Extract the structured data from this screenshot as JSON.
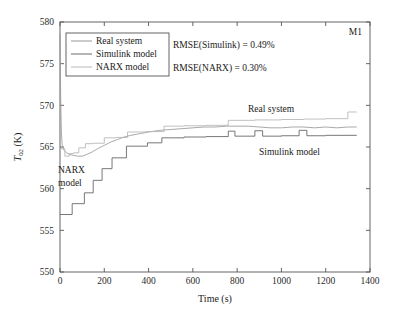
{
  "figure": {
    "corner_label": "M1",
    "background": "#ffffff"
  },
  "axes": {
    "x": {
      "title": "Time (s)",
      "min": 0,
      "max": 1400,
      "ticks": [
        0,
        200,
        400,
        600,
        800,
        1000,
        1200,
        1400
      ],
      "tick_labels": [
        "0",
        "200",
        "400",
        "600",
        "800",
        "1000",
        "1200",
        "1400"
      ]
    },
    "y": {
      "title_main": "T",
      "title_sub": "02",
      "title_unit": " (K)",
      "title": "T02 (K)",
      "min": 550,
      "max": 580,
      "ticks": [
        550,
        555,
        560,
        565,
        570,
        575,
        580
      ],
      "tick_labels": [
        "550",
        "555",
        "560",
        "565",
        "570",
        "575",
        "580"
      ]
    }
  },
  "legend": {
    "position": "top-left-inside",
    "entries": [
      {
        "label": "Real system",
        "color": "#8c8c8c"
      },
      {
        "label": "Simulink model",
        "color": "#5a5a5a"
      },
      {
        "label": "NARX model",
        "color": "#b0b0b0"
      }
    ]
  },
  "annotations": [
    {
      "name": "rmse-simulink",
      "text": "RMSE(Simulink) = 0.49%",
      "x": 173,
      "y": 48
    },
    {
      "name": "rmse-narx",
      "text": "RMSE(NARX) = 0.30%",
      "x": 173,
      "y": 71
    },
    {
      "name": "label-real-system",
      "text": "Real system",
      "x": 248,
      "y": 112
    },
    {
      "name": "label-simulink-model",
      "text": "Simulink model",
      "x": 259,
      "y": 155
    },
    {
      "name": "label-narx-model-line1",
      "text": "NARX",
      "x": 58,
      "y": 173
    },
    {
      "name": "label-narx-model-line2",
      "text": "model",
      "x": 58,
      "y": 186
    }
  ],
  "chart_data": {
    "type": "line",
    "title": "",
    "xlabel": "Time (s)",
    "ylabel": "T02 (K)",
    "xlim": [
      0,
      1400
    ],
    "ylim": [
      550,
      580
    ],
    "grid": false,
    "legend_position": "upper left",
    "series": [
      {
        "name": "Real system",
        "color": "#9a9a9a",
        "style": "smooth-stepped",
        "points": [
          [
            0,
            578.6
          ],
          [
            3,
            571.0
          ],
          [
            6,
            566.8
          ],
          [
            10,
            565.2
          ],
          [
            18,
            564.6
          ],
          [
            30,
            564.3
          ],
          [
            45,
            564.1
          ],
          [
            60,
            564.0
          ],
          [
            80,
            563.9
          ],
          [
            100,
            563.9
          ],
          [
            120,
            564.1
          ],
          [
            145,
            564.4
          ],
          [
            170,
            564.8
          ],
          [
            200,
            565.2
          ],
          [
            230,
            565.6
          ],
          [
            260,
            565.9
          ],
          [
            290,
            566.2
          ],
          [
            320,
            566.4
          ],
          [
            360,
            566.6
          ],
          [
            400,
            566.8
          ],
          [
            450,
            567.0
          ],
          [
            500,
            567.1
          ],
          [
            550,
            567.2
          ],
          [
            600,
            567.3
          ],
          [
            650,
            567.4
          ],
          [
            700,
            567.4
          ],
          [
            750,
            567.5
          ],
          [
            800,
            567.5
          ],
          [
            850,
            567.5
          ],
          [
            900,
            567.4
          ],
          [
            950,
            567.3
          ],
          [
            1000,
            567.3
          ],
          [
            1050,
            567.4
          ],
          [
            1100,
            567.4
          ],
          [
            1150,
            567.3
          ],
          [
            1200,
            567.4
          ],
          [
            1250,
            567.3
          ],
          [
            1300,
            567.4
          ],
          [
            1340,
            567.4
          ]
        ]
      },
      {
        "name": "Simulink model",
        "color": "#606060",
        "style": "stepped",
        "points": [
          [
            0,
            556.9
          ],
          [
            55,
            556.9
          ],
          [
            55,
            558.2
          ],
          [
            110,
            558.2
          ],
          [
            110,
            559.5
          ],
          [
            150,
            559.5
          ],
          [
            150,
            561.0
          ],
          [
            190,
            561.0
          ],
          [
            190,
            562.4
          ],
          [
            235,
            562.4
          ],
          [
            235,
            563.7
          ],
          [
            300,
            563.7
          ],
          [
            300,
            565.1
          ],
          [
            395,
            565.1
          ],
          [
            395,
            565.5
          ],
          [
            460,
            565.5
          ],
          [
            460,
            566.1
          ],
          [
            560,
            566.1
          ],
          [
            560,
            566.2
          ],
          [
            660,
            566.2
          ],
          [
            660,
            566.25
          ],
          [
            760,
            566.25
          ],
          [
            760,
            566.9
          ],
          [
            790,
            566.9
          ],
          [
            790,
            566.3
          ],
          [
            880,
            566.3
          ],
          [
            880,
            566.95
          ],
          [
            915,
            566.95
          ],
          [
            915,
            566.3
          ],
          [
            1000,
            566.3
          ],
          [
            1000,
            566.35
          ],
          [
            1080,
            566.35
          ],
          [
            1080,
            567.0
          ],
          [
            1115,
            567.0
          ],
          [
            1115,
            566.35
          ],
          [
            1200,
            566.35
          ],
          [
            1200,
            566.4
          ],
          [
            1260,
            566.4
          ],
          [
            1260,
            566.4
          ],
          [
            1340,
            566.4
          ]
        ]
      },
      {
        "name": "NARX model",
        "color": "#b5b5b5",
        "style": "stepped",
        "points": [
          [
            0,
            564.8
          ],
          [
            22,
            564.8
          ],
          [
            22,
            563.9
          ],
          [
            42,
            563.9
          ],
          [
            42,
            564.2
          ],
          [
            62,
            564.2
          ],
          [
            62,
            564.3
          ],
          [
            85,
            564.3
          ],
          [
            85,
            564.9
          ],
          [
            115,
            564.9
          ],
          [
            115,
            565.4
          ],
          [
            150,
            565.4
          ],
          [
            150,
            565.45
          ],
          [
            200,
            565.45
          ],
          [
            200,
            566.1
          ],
          [
            255,
            566.1
          ],
          [
            255,
            566.15
          ],
          [
            305,
            566.15
          ],
          [
            305,
            566.8
          ],
          [
            390,
            566.8
          ],
          [
            390,
            566.85
          ],
          [
            470,
            566.85
          ],
          [
            470,
            567.5
          ],
          [
            560,
            567.5
          ],
          [
            560,
            567.55
          ],
          [
            660,
            567.55
          ],
          [
            660,
            567.6
          ],
          [
            760,
            567.6
          ],
          [
            760,
            568.2
          ],
          [
            880,
            568.2
          ],
          [
            880,
            568.25
          ],
          [
            1000,
            568.25
          ],
          [
            1000,
            568.3
          ],
          [
            1100,
            568.3
          ],
          [
            1100,
            568.35
          ],
          [
            1200,
            568.35
          ],
          [
            1200,
            568.4
          ],
          [
            1300,
            568.4
          ],
          [
            1300,
            569.2
          ],
          [
            1340,
            569.2
          ]
        ]
      }
    ]
  }
}
